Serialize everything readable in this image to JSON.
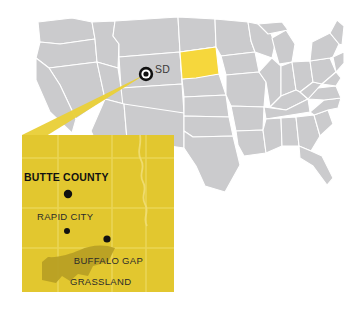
{
  "figure": {
    "kind": "locator-map"
  },
  "colors": {
    "background": "#ffffff",
    "state_fill": "#cbcbcd",
    "state_border": "#ffffff",
    "highlight_state_fill": "#f6d73c",
    "inset_fill": "#e2c72f",
    "inset_line": "#ecd65c",
    "grassland_fill": "#b8a024",
    "connector_fill": "#e9cf3a",
    "marker": "#111111",
    "label_text": "#1b1b1b"
  },
  "national_map": {
    "highlighted_state": {
      "abbr": "SD",
      "label": "SD"
    },
    "marker": {
      "name": "target-marker",
      "type": "bullseye"
    }
  },
  "inset": {
    "title": "BUTTE COUNTY",
    "places": [
      {
        "label": "RAPID CITY",
        "type": "city"
      },
      {
        "label": "BUFFALO GAP",
        "label_line2": "GRASSLAND",
        "type": "grassland"
      }
    ],
    "buffalo_gap": {
      "line1": "BUFFALO GAP",
      "line2": "GRASSLAND"
    }
  }
}
